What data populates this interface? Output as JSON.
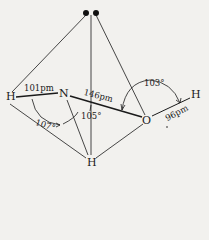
{
  "diagram": {
    "type": "molecular-geometry",
    "colors": {
      "background": "#f2f1ee",
      "ink": "#1a1a1a"
    },
    "atoms": [
      {
        "id": "h_left",
        "label": "H"
      },
      {
        "id": "n",
        "label": "N"
      },
      {
        "id": "o",
        "label": "O"
      },
      {
        "id": "h_right",
        "label": "H"
      },
      {
        "id": "h_bottom",
        "label": "H"
      }
    ],
    "lone_pair": {
      "label": "lone pair (two dots)"
    },
    "bonds": [
      {
        "from": "h_left",
        "to": "n",
        "length": "101pm"
      },
      {
        "from": "n",
        "to": "o",
        "length": "146pm"
      },
      {
        "from": "o",
        "to": "h_right",
        "length": "96pm"
      },
      {
        "from": "n",
        "to": "h_bottom",
        "length": ""
      }
    ],
    "angles": [
      {
        "label": "107°",
        "between": "H-N-H"
      },
      {
        "label": "105°",
        "between": "H-N-O"
      },
      {
        "label": "103°",
        "between": "N-O-H"
      }
    ],
    "labels": {
      "h_left": "H",
      "n": "N",
      "o": "O",
      "h_right": "H",
      "h_bottom": "H",
      "bond_hn": "101pm",
      "bond_no": "146pm",
      "bond_oh": "96pm",
      "angle_hnh": "107°",
      "angle_hno": "105°",
      "angle_noh": "103°"
    }
  }
}
